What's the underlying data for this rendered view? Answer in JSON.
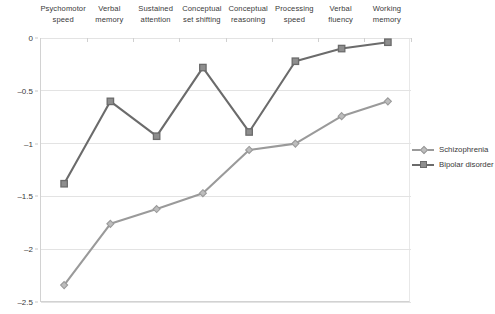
{
  "chart_data": {
    "type": "line",
    "title": "",
    "subtitle": "",
    "xlabel": "",
    "ylabel": "",
    "categories": [
      "Psychomotor\nspeed",
      "Verbal\nmemory",
      "Sustained\nattention",
      "Conceptual\nset shifting",
      "Conceptual\nreasoning",
      "Processing\nspeed",
      "Verbal\nfluency",
      "Working\nmemory"
    ],
    "series": [
      {
        "name": "Schizophrenia",
        "color": "#9a9a9a",
        "marker": "diamond",
        "values": [
          -2.34,
          -1.76,
          -1.62,
          -1.47,
          -1.06,
          -1.0,
          -0.74,
          -0.6
        ]
      },
      {
        "name": "Bipolar disorder",
        "color": "#6b6b6b",
        "marker": "square",
        "values": [
          -1.38,
          -0.6,
          -0.93,
          -0.28,
          -0.89,
          -0.22,
          -0.1,
          -0.04
        ]
      }
    ],
    "ylim": [
      -2.5,
      0
    ],
    "yticks": [
      0,
      -0.5,
      -1,
      -1.5,
      -2,
      -2.5
    ],
    "ytick_labels": [
      "0",
      "–0.5",
      "–1",
      "–1.5",
      "–2",
      "–2.5"
    ],
    "grid": true,
    "grid_color": "#e3e3e3",
    "legend_position": "right",
    "x_axis_position": "top",
    "background": "#ffffff"
  },
  "legend": {
    "entries": [
      {
        "label": "Schizophrenia"
      },
      {
        "label": "Bipolar disorder"
      }
    ]
  }
}
